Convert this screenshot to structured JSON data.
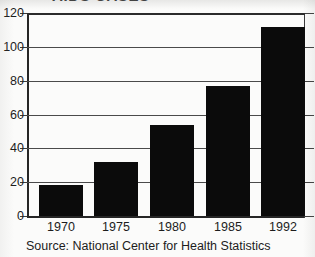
{
  "chart_data": {
    "type": "bar",
    "title": "AIDS CASES",
    "title_note": "title is cropped off at the top edge of the screenshot; only the bottom pixel row of the glyphs is visible",
    "subtitle": "",
    "xlabel": "",
    "ylabel": "",
    "categories": [
      "1970",
      "1975",
      "1980",
      "1985",
      "1992"
    ],
    "values": [
      18.5,
      32,
      54,
      77,
      112
    ],
    "ylim": [
      0,
      120
    ],
    "yticks": [
      0,
      20,
      40,
      60,
      80,
      100,
      120
    ],
    "ytick_labels": [
      "0",
      "20",
      "40",
      "60",
      "80",
      "100",
      "120"
    ],
    "grid": true,
    "grid_axis": "y",
    "legend": null,
    "legend_position": "none",
    "bar_color": "#0b0b0b",
    "background_color": "#fbfbfa",
    "axis_color": "#262626",
    "grid_color": "#4a4a4a",
    "source": "Source: National Center for Health Statistics"
  },
  "figure": {
    "source_caption": "Source: National Center for Health Statistics"
  }
}
